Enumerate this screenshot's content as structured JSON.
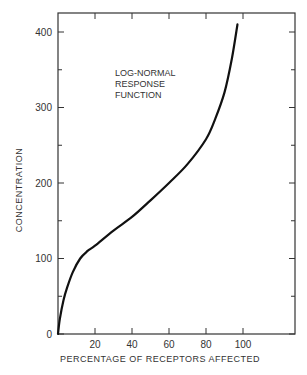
{
  "chart_data": {
    "type": "line",
    "title": "",
    "annotation": [
      "LOG-NORMAL",
      "RESPONSE",
      "FUNCTION"
    ],
    "xlabel": "PERCENTAGE OF RECEPTORS AFFECTED",
    "ylabel": "CONCENTRATION",
    "xlim": [
      0,
      128
    ],
    "ylim": [
      0,
      425
    ],
    "x_ticks": [
      20,
      40,
      60,
      80,
      100
    ],
    "x_tick_labels": [
      "20",
      "40",
      "60",
      "80",
      "100"
    ],
    "y_ticks": [
      0,
      100,
      200,
      300,
      400
    ],
    "y_tick_labels": [
      "0",
      "100",
      "200",
      "300",
      "400"
    ],
    "grid": false,
    "series": [
      {
        "name": "Log-normal response function",
        "x": [
          0,
          1,
          3,
          5,
          8,
          12,
          16,
          20,
          30,
          40,
          50,
          60,
          70,
          80,
          85,
          90,
          94,
          97
        ],
        "y": [
          0,
          20,
          45,
          62,
          82,
          100,
          110,
          117,
          137,
          155,
          177,
          200,
          225,
          258,
          285,
          320,
          365,
          410
        ]
      }
    ],
    "color": "#111111"
  }
}
